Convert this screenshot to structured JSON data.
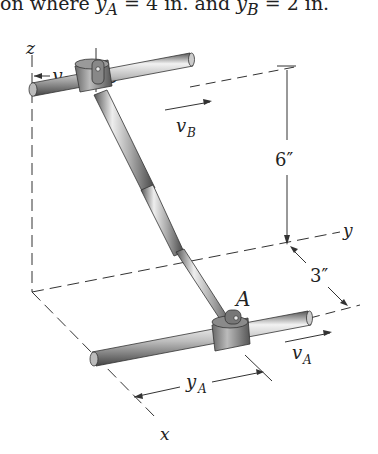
{
  "caption": {
    "prefix": "on where ",
    "ya": "y",
    "ya_sub": "A",
    "mid": " = 4 in. and ",
    "yb": "y",
    "yb_sub": "B",
    "suffix": " = 2 in."
  },
  "diagram": {
    "axes": {
      "x": "x",
      "y": "y",
      "z": "z"
    },
    "points": {
      "A": "A",
      "B": "B"
    },
    "velocities": {
      "vA": "v",
      "vA_sub": "A",
      "vB": "v",
      "vB_sub": "B"
    },
    "dimensions": {
      "yA": "y",
      "yA_sub": "A",
      "yB": "y",
      "yB_sub": "B",
      "height": "6″",
      "offset": "3″"
    },
    "colors": {
      "line": "#333333",
      "rod_light": "#e6e6e6",
      "rod_dark": "#7a7a7a",
      "collar": "#8a8a8a"
    }
  }
}
